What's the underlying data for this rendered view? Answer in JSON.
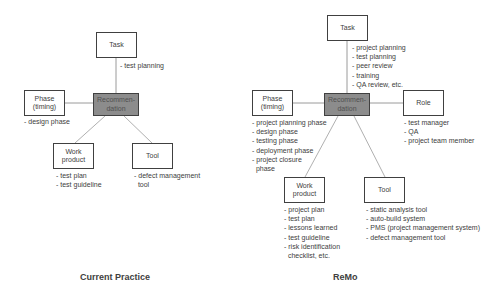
{
  "diagrams": {
    "current": {
      "caption": "Current Practice",
      "center": "Recommen-\ndation",
      "task": {
        "label": "Task",
        "items": [
          "- test planning"
        ]
      },
      "phase": {
        "label": "Phase\n(timing)",
        "items": [
          "- design phase"
        ]
      },
      "work_product": {
        "label": "Work\nproduct",
        "items": [
          "- test plan",
          "- test guideline"
        ]
      },
      "tool": {
        "label": "Tool",
        "items": [
          "- defect management",
          "  tool"
        ]
      }
    },
    "remo": {
      "caption": "ReMo",
      "center": "Recommen-\ndation",
      "task": {
        "label": "Task",
        "items": [
          "- project planning",
          "- test planning",
          "- peer review",
          "- training",
          "- QA review, etc."
        ]
      },
      "phase": {
        "label": "Phase\n(timing)",
        "items": [
          "- project planning phase",
          "- design phase",
          "- testing phase",
          "- deployment phase",
          "- project closure",
          "  phase"
        ]
      },
      "role": {
        "label": "Role",
        "items": [
          "- test manager",
          "- QA",
          "- project team member"
        ]
      },
      "work_product": {
        "label": "Work\nproduct",
        "items": [
          "- project plan",
          "- test plan",
          "- lessons learned",
          "- test guideline",
          "- risk identification",
          "  checklist, etc."
        ]
      },
      "tool": {
        "label": "Tool",
        "items": [
          "- static analysis tool",
          "- auto-build system",
          "- PMS (project management system)",
          "- defect management tool"
        ]
      }
    }
  },
  "colors": {
    "center_fill": "#8c8c8c",
    "stroke": "#404040",
    "connector": "#a0a0a0"
  }
}
